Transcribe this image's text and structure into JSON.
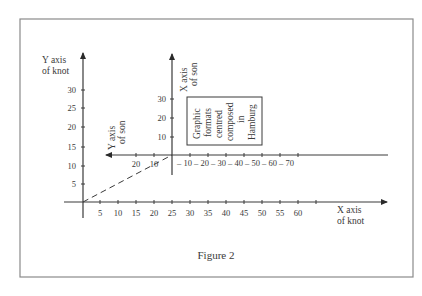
{
  "figure": {
    "caption": "Figure 2",
    "colors": {
      "line": "#3a3a3a",
      "frame": "#8a8a8a",
      "text": "#3a3a3a",
      "background": "#ffffff"
    }
  },
  "knot": {
    "y_axis_label": [
      "Y axis",
      "of knot"
    ],
    "x_axis_label": [
      "X axis",
      "of knot"
    ],
    "y_ticks": [
      "5",
      "10",
      "15",
      "20",
      "25",
      "30"
    ],
    "x_ticks": [
      "5",
      "10",
      "15",
      "20",
      "25",
      "30",
      "35",
      "40",
      "45",
      "50",
      "55",
      "60"
    ]
  },
  "son": {
    "x_axis_label": [
      "X axis",
      "of son"
    ],
    "y_axis_label": [
      "Y axis",
      "of son"
    ],
    "x_ticks_up": [
      "10",
      "20",
      "30"
    ],
    "y_ticks_left": [
      "20",
      "10"
    ],
    "right_ticks": "– 10 – 20 – 30 – 40 – 50 – 60 – 70"
  },
  "box": {
    "lines": [
      "Graphic",
      "formats",
      "centred",
      "composed",
      "in",
      "Hamburg"
    ]
  }
}
